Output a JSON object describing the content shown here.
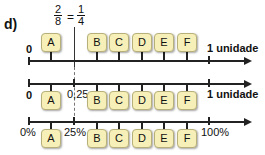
{
  "figure": {
    "label": "d)",
    "fraction": {
      "left_num": "2",
      "left_den": "8",
      "equals": "=",
      "right_num": "1",
      "right_den": "4"
    },
    "lines": [
      {
        "name": "unit-line-top",
        "start_label": "0",
        "end_label": "1 unidade",
        "boxes": [
          "A",
          "B",
          "C",
          "D",
          "E",
          "F"
        ]
      },
      {
        "name": "decimal-line",
        "start_label": "0",
        "mid_label": "0,25",
        "end_label": "1 unidade",
        "boxes": [
          "A",
          "B",
          "C",
          "D",
          "E",
          "F"
        ]
      },
      {
        "name": "percent-line",
        "start_label": "0%",
        "mid_label": "25%",
        "end_label": "100%",
        "boxes": [
          "A",
          "B",
          "C",
          "D",
          "E",
          "F"
        ]
      }
    ],
    "colors": {
      "box_fill": "#f6f0b8",
      "box_border": "#b8b07a",
      "axis": "#222222"
    }
  }
}
